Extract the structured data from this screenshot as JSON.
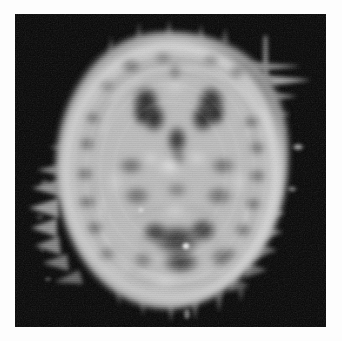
{
  "document": {
    "kind": "medical-image",
    "modality_appearance": "grayscale axial brain tomographic slice",
    "orientation": "axial",
    "colormap": "grayscale",
    "page_background": "#fdfdfd",
    "image_background": "#000000",
    "alt_text": "Grayscale axial brain scan slice on black background",
    "caption": ""
  },
  "frame": {
    "x": 15,
    "y": 14,
    "width": 311,
    "height": 313
  },
  "scan": {
    "head_center_x": 153,
    "head_center_y": 158,
    "head_radius_x": 118,
    "head_radius_y": 140,
    "scalp_ring_color": "#d8d8d8",
    "cortex_color": "#b4b4b4",
    "white_matter_color": "#9a9a9a",
    "ventricle_color": "#2a2a2a",
    "background_color": "#050505",
    "has_edge_spikes": true,
    "has_scanline_texture": true
  },
  "chart_data": {
    "type": "heatmap",
    "title": "",
    "xlabel": "",
    "ylabel": "",
    "colormap": "gray",
    "value_range": [
      0,
      255
    ],
    "grid": false,
    "legend": "none",
    "regions": [
      {
        "name": "left-frontal-ventricle-horn",
        "cx": 146,
        "cy": 100,
        "rx": 18,
        "ry": 24,
        "intensity": 28
      },
      {
        "name": "right-frontal-ventricle-horn",
        "cx": 205,
        "cy": 100,
        "rx": 18,
        "ry": 24,
        "intensity": 30
      },
      {
        "name": "third-ventricle",
        "cx": 176,
        "cy": 140,
        "rx": 10,
        "ry": 18,
        "intensity": 48
      },
      {
        "name": "posterior-dark-complex",
        "cx": 176,
        "cy": 245,
        "rx": 38,
        "ry": 26,
        "intensity": 40
      },
      {
        "name": "bright-focus-posterior",
        "cx": 186,
        "cy": 250,
        "rx": 4,
        "ry": 4,
        "intensity": 235
      },
      {
        "name": "left-cortical-band",
        "cx": 82,
        "cy": 160,
        "rx": 22,
        "ry": 85,
        "intensity": 165
      },
      {
        "name": "right-cortical-band",
        "cx": 228,
        "cy": 160,
        "rx": 22,
        "ry": 85,
        "intensity": 168
      },
      {
        "name": "scalp-ring",
        "cx": 153,
        "cy": 158,
        "rx": 118,
        "ry": 140,
        "intensity": 200
      },
      {
        "name": "isolated-bright-speck-right",
        "cx": 283,
        "cy": 133,
        "rx": 6,
        "ry": 4,
        "intensity": 150
      },
      {
        "name": "edge-spike-cluster-left",
        "cx": 36,
        "cy": 190,
        "rx": 14,
        "ry": 55,
        "intensity": 130
      },
      {
        "name": "edge-spike-superior-right",
        "cx": 251,
        "cy": 30,
        "rx": 3,
        "ry": 14,
        "intensity": 120
      }
    ]
  }
}
